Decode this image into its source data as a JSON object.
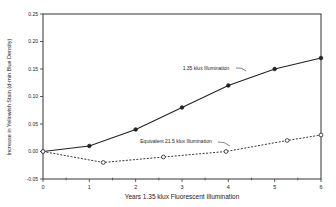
{
  "chart_data": {
    "type": "line",
    "title": "",
    "xlabel": "Years 1.35 klux Fluorescent Illumination",
    "ylabel": "Increase in Yellowish Stain (d-min Blue Density)",
    "xlim": [
      0,
      6
    ],
    "ylim": [
      -0.05,
      0.25
    ],
    "x_ticks": [
      "0",
      "1",
      "2",
      "3",
      "4",
      "5",
      "6"
    ],
    "y_ticks": [
      "-0.05",
      "0.00",
      "0.05",
      "0.10",
      "0.15",
      "0.20",
      "0.25"
    ],
    "grid": false,
    "legend_position": "inline annotations",
    "series": [
      {
        "name": "1.35 klux Illumination",
        "style": "solid",
        "marker": "filled-circle",
        "x": [
          0,
          1,
          2,
          3,
          4,
          5,
          6
        ],
        "y": [
          0.0,
          0.01,
          0.04,
          0.08,
          0.12,
          0.15,
          0.17
        ]
      },
      {
        "name": "Equivalent 21.5 klux Illumination",
        "style": "dashed",
        "marker": "open-circle",
        "x": [
          0,
          1.3,
          2.6,
          3.95,
          5.27,
          6
        ],
        "y": [
          0.0,
          -0.02,
          -0.01,
          0.0,
          0.02,
          0.03
        ]
      }
    ],
    "annotations": [
      {
        "text": "1.35 klux Illumination",
        "series": 0
      },
      {
        "text": "Equivalent 21.5 klux Illumination",
        "series": 1
      }
    ]
  },
  "labels": {
    "xlabel": "Years 1.35 klux Fluorescent Illumination",
    "ylabel": "Increase in Yellowish Stain (d-min Blue Density)",
    "annot_solid": "1.35 klux Illumination",
    "annot_dashed": "Equivalent 21.5 klux Illumination"
  },
  "colors": {
    "line": "#222222",
    "axis": "#333333"
  }
}
